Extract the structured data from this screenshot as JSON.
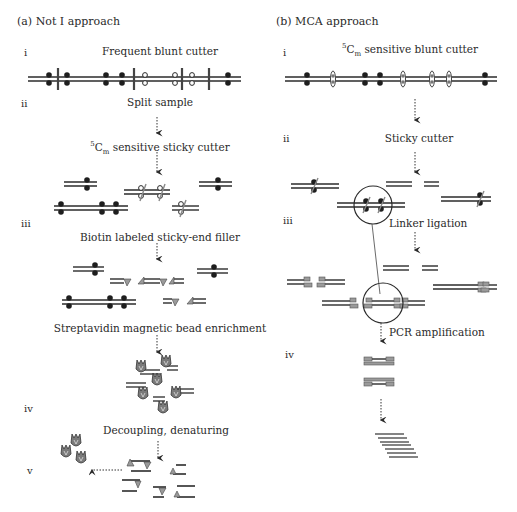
{
  "panel_a": {
    "title": "(a)  Not I approach",
    "steps": {
      "i": "i",
      "ii": "ii",
      "iii": "iii",
      "iv": "iv",
      "v": "v"
    },
    "labels": {
      "frequent_blunt_cutter": "Frequent blunt cutter",
      "split_sample": "Split sample",
      "sensitive_sticky_cutter_sup": "5",
      "sensitive_sticky_cutter_c": "C",
      "sensitive_sticky_cutter_sub": "m",
      "sensitive_sticky_cutter_rest": " sensitive sticky cutter",
      "biotin_filler": "Biotin labeled sticky-end filler",
      "streptavidin": "Streptavidin magnetic bead enrichment",
      "decoupling": "Decoupling, denaturing"
    }
  },
  "panel_b": {
    "title": "(b)  MCA approach",
    "steps": {
      "i": "i",
      "ii": "ii",
      "iii": "iii",
      "iv": "iv"
    },
    "labels": {
      "blunt_cutter_sup": "5",
      "blunt_cutter_c": "C",
      "blunt_cutter_sub": "m",
      "blunt_cutter_rest": " sensitive blunt cutter",
      "sticky_cutter": "Sticky cutter",
      "linker_ligation": "Linker ligation",
      "pcr_amplification": "PCR amplification"
    }
  },
  "colors": {
    "dna": "#2b2b2b",
    "text": "#2a2a2a",
    "gray_fill": "#9a9a9a",
    "bead": "#7a7a7a"
  }
}
